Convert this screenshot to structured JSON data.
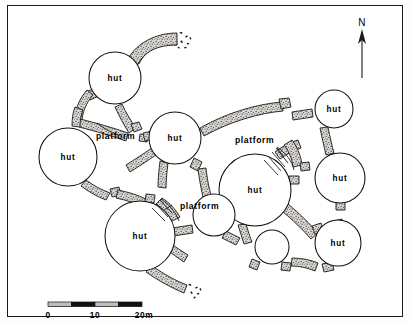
{
  "figure": {
    "type": "archaeological-site-plan",
    "background_color": "#ffffff",
    "ink_color": "#000000",
    "wall_fill": "#cfcac4"
  },
  "north_arrow": {
    "label": "N",
    "x": 372,
    "y": 26
  },
  "scale_bar": {
    "unit_label": "20m",
    "ticks": [
      {
        "label": "0",
        "value": 0
      },
      {
        "label": "10",
        "value": 10
      },
      {
        "label": "20m",
        "value": 20
      }
    ],
    "segments": 4,
    "segment_colors": [
      "#bdbdbd",
      "#111111",
      "#bdbdbd",
      "#111111"
    ],
    "x": 48,
    "y": 302,
    "width": 94,
    "height": 5
  },
  "structures": {
    "huts": [
      {
        "id": "hut-nw-top",
        "label": "hut",
        "cx": 115,
        "cy": 78,
        "r": 26
      },
      {
        "id": "hut-west",
        "label": "hut",
        "cx": 68,
        "cy": 157,
        "r": 29
      },
      {
        "id": "hut-center",
        "label": "hut",
        "cx": 175,
        "cy": 138,
        "r": 26
      },
      {
        "id": "hut-sw-large",
        "label": "hut",
        "cx": 140,
        "cy": 236,
        "r": 35
      },
      {
        "id": "hut-core",
        "label": "hut",
        "cx": 255,
        "cy": 190,
        "r": 36
      },
      {
        "id": "hut-ne",
        "label": "hut",
        "cx": 334,
        "cy": 109,
        "r": 19
      },
      {
        "id": "hut-east",
        "label": "hut",
        "cx": 340,
        "cy": 178,
        "r": 25
      },
      {
        "id": "hut-se",
        "label": "hut",
        "cx": 338,
        "cy": 243,
        "r": 23
      }
    ],
    "unlabeled_circles": [
      {
        "id": "circle-mid-small",
        "cx": 214,
        "cy": 215,
        "r": 21
      },
      {
        "id": "circle-low-small",
        "cx": 272,
        "cy": 247,
        "r": 17
      }
    ],
    "platform_labels": [
      {
        "label": "platform",
        "x": 96,
        "y": 139,
        "anchor": "start"
      },
      {
        "label": "platform",
        "x": 235,
        "y": 143,
        "anchor": "start"
      },
      {
        "label": "platform",
        "x": 180,
        "y": 209,
        "anchor": "start"
      }
    ]
  }
}
